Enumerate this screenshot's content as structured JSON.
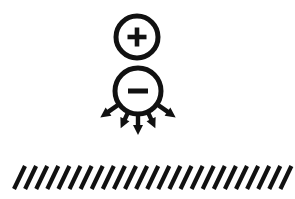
{
  "figure": {
    "background_color": "#ffffff",
    "ink_color": "#111111",
    "width": 295,
    "height": 199
  },
  "charges": [
    {
      "name": "positive-charge",
      "sign_symbol": "+",
      "sign_label": "plus",
      "center_x": 137,
      "center_y": 37,
      "radius": 21,
      "ring_stroke_width": 5,
      "sign_bar_length": 19,
      "sign_bar_thickness": 4.6
    },
    {
      "name": "negative-charge",
      "sign_symbol": "−",
      "sign_label": "minus",
      "center_x": 138,
      "center_y": 91,
      "radius": 23,
      "ring_stroke_width": 5,
      "sign_bar_length": 20,
      "sign_bar_thickness": 5.0
    }
  ],
  "field_arrows": {
    "name": "downward-field-arrows",
    "count": 5,
    "origin_x": 138,
    "origin_y": 91,
    "stroke_width": 4.4,
    "head_length": 10,
    "head_width": 10,
    "rays": [
      {
        "angle_deg": 145,
        "start_radius": 22,
        "end_radius": 46
      },
      {
        "angle_deg": 115,
        "start_radius": 22,
        "end_radius": 41
      },
      {
        "angle_deg": 90,
        "start_radius": 22,
        "end_radius": 44
      },
      {
        "angle_deg": 65,
        "start_radius": 22,
        "end_radius": 41
      },
      {
        "angle_deg": 35,
        "start_radius": 22,
        "end_radius": 46
      }
    ]
  },
  "ground": {
    "name": "hatched-ground",
    "hatch_count": 25,
    "x_start": 14,
    "x_end": 281,
    "y_top": 166,
    "y_bottom": 189,
    "slant_dx": 11,
    "stroke_width": 4.2,
    "spacing": 11.1
  }
}
